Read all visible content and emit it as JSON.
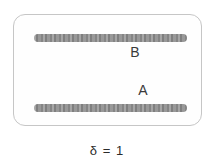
{
  "figure": {
    "panel": {
      "top_bar": {
        "name": "top-bar",
        "label": "B"
      },
      "bottom_bar": {
        "name": "bottom-bar",
        "label": "A"
      }
    },
    "caption": "δ = 1",
    "colors": {
      "bar_gray": "#8d8d8d",
      "panel_border": "#c6c6c6",
      "panel_background": "#fefefe",
      "label_text": "#3a3a3a",
      "caption_text": "#2b2b2b"
    }
  }
}
